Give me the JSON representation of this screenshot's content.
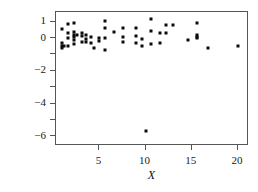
{
  "figure": {
    "width": 258,
    "height": 192,
    "background": "#ffffff",
    "point_color": "#0b0b0b",
    "axis_color": "#555555"
  },
  "axis_titles": {
    "y": "Residuals",
    "x": "X"
  },
  "y_axis": {
    "ticks": [
      1,
      0,
      -1,
      -2,
      -3,
      -4,
      -5,
      -6
    ],
    "labeled_ticks": [
      {
        "value": 1,
        "label": "1"
      },
      {
        "value": 0,
        "label": "0"
      },
      {
        "value": -2,
        "label": "−2"
      },
      {
        "value": -4,
        "label": "−4"
      },
      {
        "value": -6,
        "label": "−6"
      }
    ],
    "range": [
      -6.6,
      1.6
    ]
  },
  "x_axis": {
    "ticks": [
      5,
      10,
      15,
      20
    ],
    "labeled_ticks": [
      {
        "value": 5,
        "label": "5"
      },
      {
        "value": 10,
        "label": "10"
      },
      {
        "value": 15,
        "label": "15"
      },
      {
        "value": 20,
        "label": "20"
      }
    ],
    "range": [
      0.3,
      21.2
    ]
  },
  "chart_data": {
    "type": "scatter",
    "title": "",
    "xlabel": "X",
    "ylabel": "Residuals",
    "xlim": [
      0.3,
      21.2
    ],
    "ylim": [
      -6.6,
      1.6
    ],
    "grid": false,
    "legend": null,
    "series": [
      {
        "name": "residuals",
        "marker": "square",
        "color": "#0b0b0b",
        "points": [
          [
            1.0,
            0.55
          ],
          [
            1.0,
            -0.3
          ],
          [
            1.0,
            -0.45
          ],
          [
            1.0,
            -0.6
          ],
          [
            1.2,
            -0.5
          ],
          [
            1.6,
            0.88
          ],
          [
            1.6,
            0.3
          ],
          [
            1.6,
            -0.02
          ],
          [
            1.6,
            -0.48
          ],
          [
            2.2,
            0.92
          ],
          [
            2.2,
            0.4
          ],
          [
            2.2,
            0.18
          ],
          [
            2.2,
            0.05
          ],
          [
            2.2,
            -0.1
          ],
          [
            2.2,
            -0.35
          ],
          [
            2.6,
            0.22
          ],
          [
            3.1,
            0.32
          ],
          [
            3.1,
            0.12
          ],
          [
            3.1,
            -0.25
          ],
          [
            3.6,
            0.18
          ],
          [
            3.6,
            -0.05
          ],
          [
            3.6,
            -0.22
          ],
          [
            4.1,
            0.05
          ],
          [
            4.1,
            -0.32
          ],
          [
            4.4,
            -0.6
          ],
          [
            5.0,
            0.02
          ],
          [
            5.0,
            -0.18
          ],
          [
            5.6,
            1.02
          ],
          [
            5.6,
            0.62
          ],
          [
            5.6,
            0.02
          ],
          [
            5.6,
            -0.7
          ],
          [
            6.6,
            0.35
          ],
          [
            7.6,
            0.6
          ],
          [
            7.6,
            0.05
          ],
          [
            7.6,
            -0.25
          ],
          [
            9.0,
            0.62
          ],
          [
            9.0,
            0.12
          ],
          [
            9.0,
            -0.28
          ],
          [
            9.6,
            -0.05
          ],
          [
            9.6,
            -0.48
          ],
          [
            10.0,
            -5.7
          ],
          [
            10.6,
            1.2
          ],
          [
            10.6,
            0.42
          ],
          [
            10.6,
            -0.38
          ],
          [
            11.6,
            0.3
          ],
          [
            11.6,
            -0.3
          ],
          [
            12.2,
            0.78
          ],
          [
            12.2,
            0.3
          ],
          [
            13.0,
            0.8
          ],
          [
            14.6,
            -0.12
          ],
          [
            15.6,
            0.92
          ],
          [
            15.6,
            0.22
          ],
          [
            15.6,
            0.1
          ],
          [
            15.6,
            0.02
          ],
          [
            16.8,
            -0.6
          ],
          [
            20.0,
            -0.48
          ]
        ]
      }
    ]
  }
}
